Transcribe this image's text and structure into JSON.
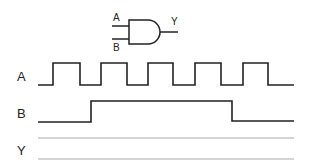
{
  "gate": {
    "type": "AND",
    "input_a_label": "A",
    "input_b_label": "B",
    "output_label": "Y"
  },
  "timing": {
    "row_labels": {
      "a": "A",
      "b": "B",
      "y": "Y"
    },
    "signals": [
      {
        "name": "A",
        "description": "square wave, 5 pulses",
        "transitions_x": [
          53,
          80,
          101,
          127,
          148,
          173,
          195,
          221,
          243,
          268
        ]
      },
      {
        "name": "B",
        "description": "single pulse",
        "transitions_x": [
          91,
          232
        ]
      },
      {
        "name": "Y",
        "description": "blank (to be filled in)"
      }
    ]
  },
  "colors": {
    "line": "#222222",
    "guide": "#aaaaaa",
    "background": "#ffffff"
  }
}
